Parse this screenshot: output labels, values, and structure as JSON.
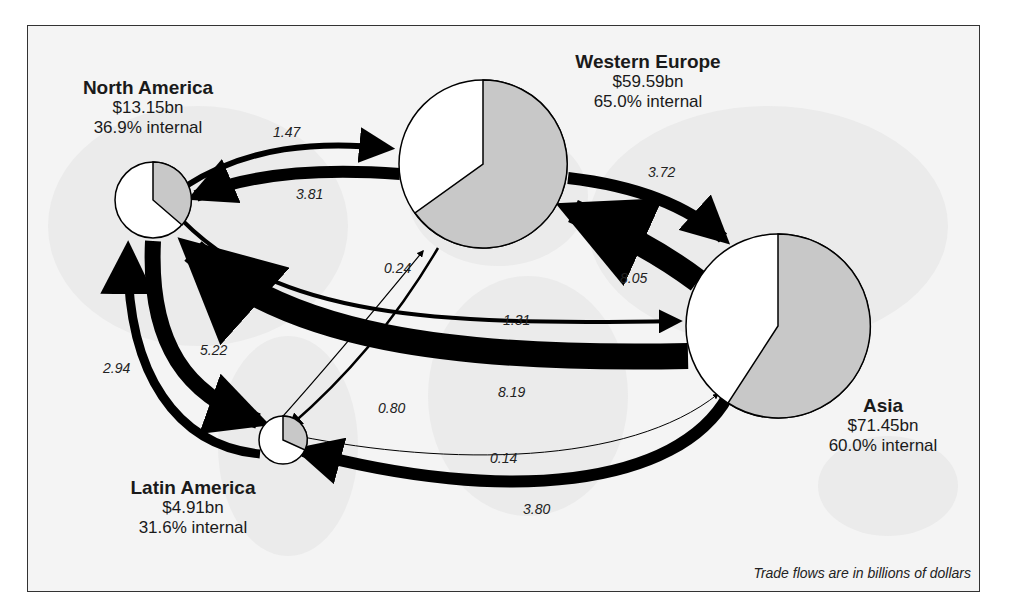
{
  "diagram": {
    "note": "Trade flows are in billions of dollars",
    "colors": {
      "arrow": "#000000",
      "pie_internal": "#c8c8c8",
      "pie_external": "#ffffff",
      "background": "#f4f4f4"
    },
    "regions": [
      {
        "id": "north-america",
        "name": "North America",
        "total": "$13.15bn",
        "internal": "36.9% internal",
        "internal_pct": 36.9
      },
      {
        "id": "western-europe",
        "name": "Western Europe",
        "total": "$59.59bn",
        "internal": "65.0% internal",
        "internal_pct": 65.0
      },
      {
        "id": "asia",
        "name": "Asia",
        "total": "$71.45bn",
        "internal": "60.0% internal",
        "internal_pct": 60.0
      },
      {
        "id": "latin-america",
        "name": "Latin America",
        "total": "$4.91bn",
        "internal": "31.6% internal",
        "internal_pct": 31.6
      }
    ],
    "flows": [
      {
        "from": "North America",
        "to": "Western Europe",
        "value": "1.47"
      },
      {
        "from": "Western Europe",
        "to": "North America",
        "value": "3.81"
      },
      {
        "from": "Western Europe",
        "to": "Asia",
        "value": "3.72"
      },
      {
        "from": "Asia",
        "to": "Western Europe",
        "value": "8.05"
      },
      {
        "from": "North America",
        "to": "Asia",
        "value": "1.31"
      },
      {
        "from": "Asia",
        "to": "North America",
        "value": "8.19"
      },
      {
        "from": "Latin America",
        "to": "Western Europe",
        "value": "0.24"
      },
      {
        "from": "Western Europe",
        "to": "Latin America",
        "value": "0.80"
      },
      {
        "from": "North America",
        "to": "Latin America",
        "value": "5.22"
      },
      {
        "from": "Latin America",
        "to": "North America",
        "value": "2.94"
      },
      {
        "from": "Latin America",
        "to": "Asia",
        "value": "0.14"
      },
      {
        "from": "Asia",
        "to": "Latin America",
        "value": "3.80"
      }
    ]
  }
}
